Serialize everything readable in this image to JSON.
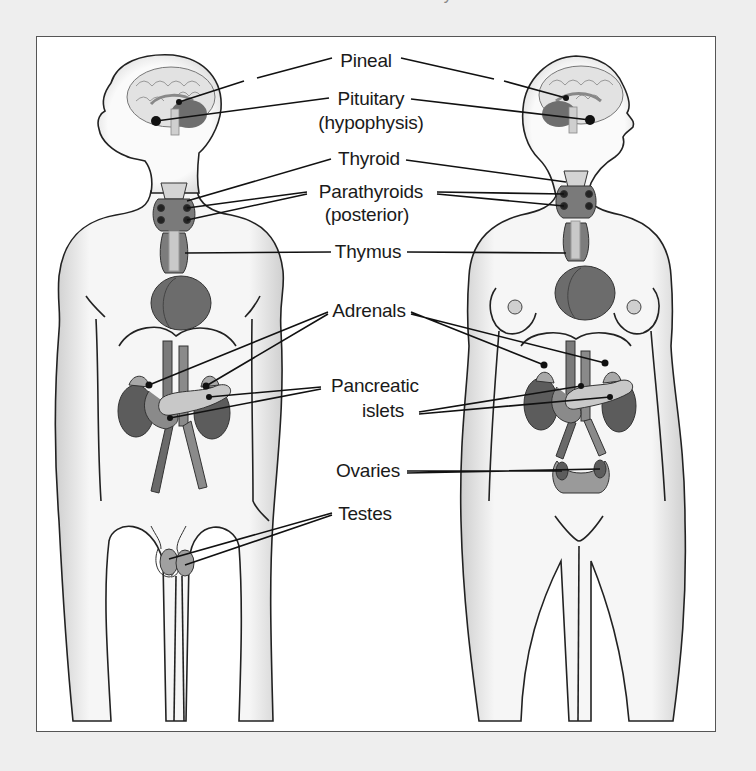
{
  "caption_fragment": "The endocrine system in men and women",
  "figures": {
    "male": "male-figure",
    "female": "female-figure"
  },
  "labels": [
    {
      "id": "pineal",
      "text": "Pineal",
      "x": 365,
      "y": 49
    },
    {
      "id": "pituitary",
      "text": "Pituitary",
      "x": 370,
      "y": 87
    },
    {
      "id": "hypophysis",
      "text": "(hypophysis)",
      "x": 370,
      "y": 111
    },
    {
      "id": "thyroid",
      "text": "Thyroid",
      "x": 368,
      "y": 147
    },
    {
      "id": "parathyroids",
      "text": "Parathyroids",
      "x": 370,
      "y": 180
    },
    {
      "id": "posterior",
      "text": "(posterior)",
      "x": 366,
      "y": 203
    },
    {
      "id": "thymus",
      "text": "Thymus",
      "x": 367,
      "y": 240
    },
    {
      "id": "adrenals",
      "text": "Adrenals",
      "x": 368,
      "y": 299
    },
    {
      "id": "pancreatic",
      "text": "Pancreatic",
      "x": 374,
      "y": 374
    },
    {
      "id": "islets",
      "text": "islets",
      "x": 382,
      "y": 399
    },
    {
      "id": "ovaries",
      "text": "Ovaries",
      "x": 367,
      "y": 459
    },
    {
      "id": "testes",
      "text": "Testes",
      "x": 364,
      "y": 502
    }
  ],
  "colors": {
    "background": "#eeeeee",
    "frame_fill": "#ffffff",
    "outline": "#222222",
    "organ_dark": "#6a6a6a",
    "organ_mid": "#8c8c8c",
    "organ_light": "#bdbdbd",
    "brain": "#e4e4e4",
    "body_shade": "#d8d8d8"
  }
}
